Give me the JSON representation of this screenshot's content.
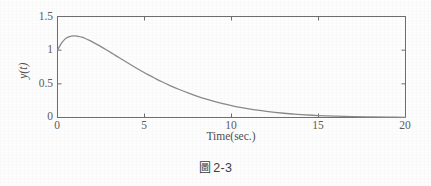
{
  "figure": {
    "caption_symbol": "圖",
    "caption_number": "2-3"
  },
  "colors": {
    "curve": "#8a8a8a",
    "axis": "#6e6e6e",
    "text": "#4f4f4f",
    "background": "#fdfdfd"
  },
  "chart_data": {
    "type": "line",
    "title": "",
    "subtitle": "",
    "xlabel": "Time(sec.)",
    "ylabel": "y(t)",
    "xlim": [
      0,
      20
    ],
    "ylim": [
      0,
      1.5
    ],
    "xticks": [
      0,
      5,
      10,
      15,
      20
    ],
    "xtick_labels": [
      "0",
      "5",
      "10",
      "15",
      "20"
    ],
    "yticks": [
      0,
      0.5,
      1,
      1.5
    ],
    "ytick_labels": [
      "0",
      "0.5",
      "1",
      "1.5"
    ],
    "grid": false,
    "legend": null,
    "annotations": [],
    "series": [
      {
        "name": "y(t)",
        "color": "#8a8a8a",
        "linewidth": 1.3,
        "x": [
          0,
          0.2,
          0.4,
          0.6,
          0.8,
          1,
          1.2,
          1.4,
          1.6,
          1.8,
          2,
          2.4,
          2.8,
          3.2,
          3.6,
          4,
          4.4,
          4.8,
          5.2,
          5.6,
          6,
          6.5,
          7,
          7.5,
          8,
          8.5,
          9,
          9.5,
          10,
          10.5,
          11,
          11.5,
          12,
          12.5,
          13,
          13.5,
          14,
          15,
          16,
          17,
          18,
          19,
          20
        ],
        "y": [
          1.0,
          1.095,
          1.157,
          1.193,
          1.21,
          1.213,
          1.206,
          1.192,
          1.173,
          1.15,
          1.124,
          1.067,
          1.006,
          0.943,
          0.879,
          0.816,
          0.754,
          0.694,
          0.637,
          0.583,
          0.531,
          0.471,
          0.416,
          0.365,
          0.319,
          0.277,
          0.24,
          0.206,
          0.177,
          0.151,
          0.128,
          0.108,
          0.091,
          0.076,
          0.063,
          0.052,
          0.043,
          0.029,
          0.019,
          0.012,
          0.008,
          0.005,
          0.003
        ]
      }
    ]
  }
}
